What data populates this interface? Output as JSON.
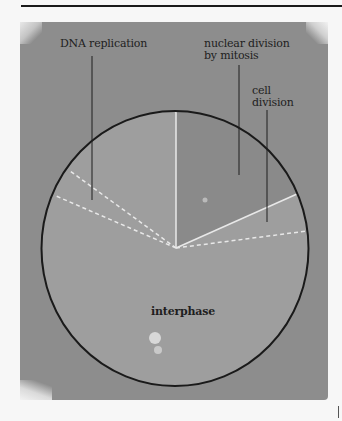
{
  "figure": {
    "labels": {
      "dna_replication": "DNA replication",
      "nuclear_division_line1": "nuclear division",
      "nuclear_division_line2": "by mitosis",
      "cell_division_line1": "cell",
      "cell_division_line2": "division",
      "interphase": "interphase"
    },
    "colors": {
      "page_background": "#f7f7f7",
      "photo_background": "#8d8d8d",
      "interphase_fill": "#9e9e9e",
      "mitosis_fill": "#8a8a8a",
      "circle_outline": "#1a1a1a",
      "divider_lines": "#e8e8e8",
      "leader_lines": "#1e1e1e"
    },
    "phases": [
      {
        "name": "interphase",
        "style": "lighter sector, majority of circle"
      },
      {
        "name": "DNA replication",
        "style": "dashed-bounded sector within interphase"
      },
      {
        "name": "nuclear division by mitosis",
        "style": "darker sector, solid white boundaries"
      },
      {
        "name": "cell division",
        "style": "dashed-bounded sector after mitosis"
      }
    ]
  }
}
